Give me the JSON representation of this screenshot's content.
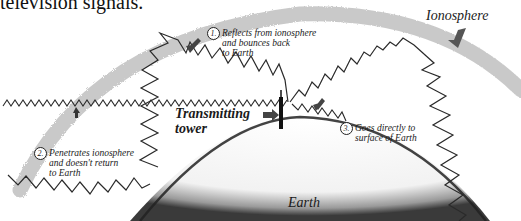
{
  "heading": "television signals.",
  "labels": {
    "ionosphere": "Ionosphere",
    "tower_line1": "Transmitting",
    "tower_line2": "tower",
    "earth": "Earth"
  },
  "notes": [
    {
      "number": "1.",
      "lines": [
        "Reflects from ionosphere",
        "and bounces back",
        "to Earth"
      ]
    },
    {
      "number": "2.",
      "lines": [
        "Penetrates ionosphere",
        "and doesn't return",
        "to Earth"
      ]
    },
    {
      "number": "3.",
      "lines": [
        "Goes directly to",
        "surface of Earth"
      ]
    }
  ],
  "colors": {
    "ionosphere_band": "#bdbdbd",
    "earth_shading": "#555555",
    "wave_stroke": "#2a2a2a",
    "tower": "#111111",
    "arrow": "#444444"
  }
}
